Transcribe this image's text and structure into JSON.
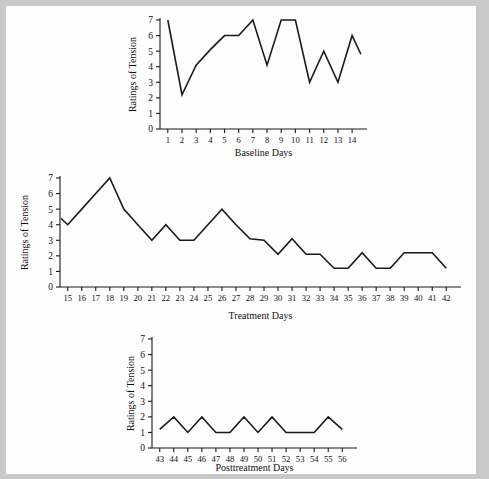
{
  "figure": {
    "background_color": "#fdfdfd",
    "border_color": "#c9c9c9",
    "line_color": "#1a1a1a",
    "axis_color": "#1a1a1a"
  },
  "panels": [
    {
      "id": "baseline",
      "ylabel": "Ratings of Tension",
      "xlabel": "Baseline Days",
      "ytick_labels": [
        "0",
        "1",
        "2",
        "3",
        "4",
        "5",
        "6",
        "7"
      ],
      "xtick_labels": [
        "1",
        "2",
        "3",
        "4",
        "5",
        "6",
        "7",
        "8",
        "9",
        "10",
        "11",
        "12",
        "13",
        "14"
      ]
    },
    {
      "id": "treatment",
      "ylabel": "Ratings of Tension",
      "xlabel": "Treatment Days",
      "ytick_labels": [
        "0",
        "1",
        "2",
        "3",
        "4",
        "5",
        "6",
        "7"
      ],
      "xtick_labels": [
        "15",
        "16",
        "17",
        "18",
        "19",
        "20",
        "21",
        "22",
        "23",
        "24",
        "25",
        "26",
        "27",
        "28",
        "29",
        "30",
        "31",
        "32",
        "33",
        "34",
        "35",
        "36",
        "37",
        "38",
        "39",
        "40",
        "41",
        "42"
      ]
    },
    {
      "id": "posttreatment",
      "ylabel": "Ratings of Tension",
      "xlabel": "Posttreatment Days",
      "ytick_labels": [
        "0",
        "1",
        "2",
        "3",
        "4",
        "5",
        "6",
        "7"
      ],
      "xtick_labels": [
        "43",
        "44",
        "45",
        "46",
        "47",
        "48",
        "49",
        "50",
        "51",
        "52",
        "53",
        "54",
        "55",
        "56"
      ]
    }
  ],
  "chart_data": [
    {
      "type": "line",
      "id": "baseline",
      "title": "",
      "xlabel": "Baseline Days",
      "ylabel": "Ratings of Tension",
      "ylim": [
        0,
        7
      ],
      "grid": false,
      "legend": false,
      "x": [
        1,
        2,
        3,
        4,
        5,
        6,
        7,
        8,
        9,
        10,
        11,
        12,
        13,
        14
      ],
      "values": [
        7.0,
        2.2,
        4.1,
        5.1,
        6.0,
        6.0,
        7.0,
        4.1,
        7.0,
        7.0,
        3.0,
        5.0,
        3.0,
        6.0
      ],
      "trailing_segment_end_value": 4.8
    },
    {
      "type": "line",
      "id": "treatment",
      "title": "",
      "xlabel": "Treatment Days",
      "ylabel": "Ratings of Tension",
      "ylim": [
        0,
        7
      ],
      "grid": false,
      "legend": false,
      "leading_segment_start_value": 4.4,
      "x": [
        15,
        16,
        17,
        18,
        19,
        20,
        21,
        22,
        23,
        24,
        25,
        26,
        27,
        28,
        29,
        30,
        31,
        32,
        33,
        34,
        35,
        36,
        37,
        38,
        39,
        40,
        41,
        42
      ],
      "values": [
        4.0,
        5.0,
        6.0,
        7.0,
        5.0,
        4.0,
        3.0,
        4.0,
        3.0,
        3.0,
        4.0,
        5.0,
        4.0,
        3.1,
        3.0,
        2.1,
        3.1,
        2.1,
        2.1,
        1.2,
        1.2,
        2.2,
        1.2,
        1.2,
        2.2,
        2.2,
        2.2,
        1.2
      ]
    },
    {
      "type": "line",
      "id": "posttreatment",
      "title": "",
      "xlabel": "Posttreatment Days",
      "ylabel": "Ratings of Tension",
      "ylim": [
        0,
        7
      ],
      "grid": false,
      "legend": false,
      "x": [
        43,
        44,
        45,
        46,
        47,
        48,
        49,
        50,
        51,
        52,
        53,
        54,
        55,
        56
      ],
      "values": [
        1.2,
        2.0,
        1.0,
        2.0,
        1.0,
        1.0,
        2.0,
        1.0,
        2.0,
        1.0,
        1.0,
        1.0,
        2.0,
        1.2
      ]
    }
  ]
}
